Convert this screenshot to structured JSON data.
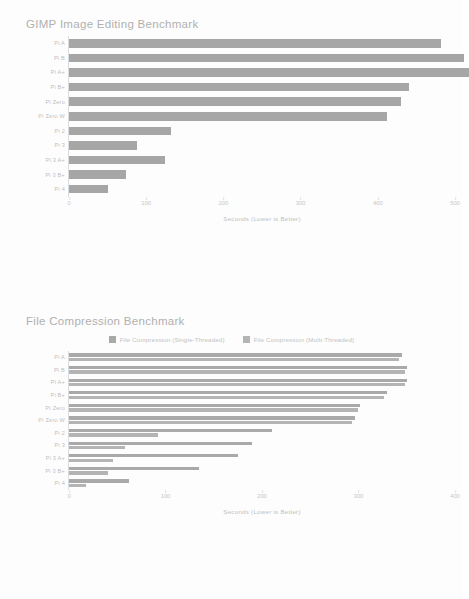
{
  "document": {
    "kind": "benchmark-report",
    "background_color": "#fdfdfd",
    "text_color": "#bdbdbd",
    "bar_color": "#a6a6a6",
    "bar_color_secondary": "#b0b0b0"
  },
  "chart_data": [
    {
      "type": "bar",
      "orientation": "horizontal",
      "title": "GIMP Image Editing Benchmark",
      "xlabel": "Seconds (Lower is Better)",
      "ylabel": "",
      "xlim": [
        0,
        500
      ],
      "xticks": [
        0,
        100,
        200,
        300,
        400,
        500
      ],
      "xticklabels": [
        "0",
        "100",
        "200",
        "300",
        "400",
        "500"
      ],
      "grid": false,
      "legend": null,
      "categories": [
        "Pi A",
        "Pi B",
        "Pi A+",
        "Pi B+",
        "Pi Zero",
        "Pi Zero W",
        "Pi 2",
        "Pi 3",
        "Pi 3 A+",
        "Pi 3 B+",
        "Pi 4"
      ],
      "values": [
        482,
        512,
        518,
        440,
        430,
        412,
        132,
        88,
        124,
        74,
        50
      ],
      "series": [
        {
          "name": "GIMP Image Editing",
          "color": "#a6a6a6",
          "values": [
            482,
            512,
            518,
            440,
            430,
            412,
            132,
            88,
            124,
            74,
            50
          ]
        }
      ]
    },
    {
      "type": "bar",
      "orientation": "horizontal",
      "title": "File Compression Benchmark",
      "xlabel": "Seconds (Lower is Better)",
      "ylabel": "",
      "xlim": [
        0,
        400
      ],
      "xticks": [
        0,
        100,
        200,
        300,
        400
      ],
      "xticklabels": [
        "0",
        "100",
        "200",
        "300",
        "400"
      ],
      "grid": false,
      "legend": {
        "position": "top-center",
        "entries": [
          {
            "label": "File Compression (Single-Threaded)",
            "color": "#a9a9a9"
          },
          {
            "label": "File Compression (Multi-Threaded)",
            "color": "#b4b4b4"
          }
        ]
      },
      "categories": [
        "Pi A",
        "Pi B",
        "Pi A+",
        "Pi B+",
        "Pi Zero",
        "Pi Zero W",
        "Pi 2",
        "Pi 3",
        "Pi 3 A+",
        "Pi 3 B+",
        "Pi 4"
      ],
      "series": [
        {
          "name": "File Compression (Single-Threaded)",
          "color": "#a9a9a9",
          "values": [
            345,
            350,
            350,
            330,
            302,
            296,
            210,
            190,
            175,
            135,
            62
          ]
        },
        {
          "name": "File Compression (Multi-Threaded)",
          "color": "#b4b4b4",
          "values": [
            342,
            348,
            348,
            326,
            299,
            293,
            92,
            58,
            46,
            40,
            18
          ]
        }
      ]
    }
  ]
}
